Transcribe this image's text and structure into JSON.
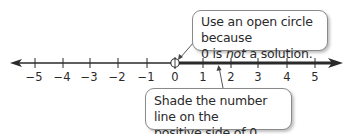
{
  "number_line": {
    "min": -5,
    "max": 5,
    "ticks": [
      {
        "value": -5,
        "label": "−5"
      },
      {
        "value": -4,
        "label": "−4"
      },
      {
        "value": -3,
        "label": "−3"
      },
      {
        "value": -2,
        "label": "−2"
      },
      {
        "value": -1,
        "label": "−1"
      },
      {
        "value": 0,
        "label": "0"
      },
      {
        "value": 1,
        "label": "1"
      },
      {
        "value": 2,
        "label": "2"
      },
      {
        "value": 3,
        "label": "3"
      },
      {
        "value": 4,
        "label": "4"
      },
      {
        "value": 5,
        "label": "5"
      }
    ],
    "open_circle_at": 0,
    "shaded_direction": "positive",
    "line_color": "#2a2a2a"
  },
  "callouts": {
    "top": {
      "line1": "Use an open circle because",
      "line2_before": "0 is ",
      "line2_em": "not",
      "line2_after": " a solution."
    },
    "bottom": {
      "line1": "Shade the number line on the",
      "line2": "positive side of 0."
    }
  }
}
